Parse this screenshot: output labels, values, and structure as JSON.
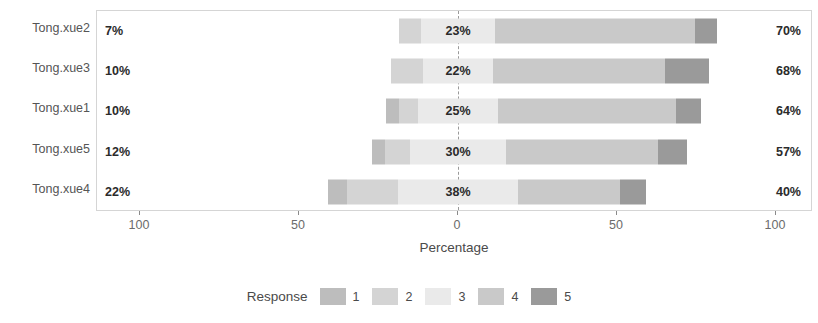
{
  "chart_data": {
    "type": "bar",
    "subtype": "diverging-stacked-likert",
    "title": "",
    "xlabel": "Percentage",
    "ylabel": "",
    "xlim": [
      -100,
      100
    ],
    "xticks": [
      -100,
      -50,
      0,
      50,
      100
    ],
    "xticklabels": [
      "100",
      "50",
      "0",
      "50",
      "100"
    ],
    "grid": false,
    "legend_title": "Response",
    "legend_position": "bottom",
    "categories": [
      "Tong.xue2",
      "Tong.xue3",
      "Tong.xue1",
      "Tong.xue5",
      "Tong.xue4"
    ],
    "series": [
      {
        "name": "1",
        "color": "#bdbdbd",
        "values": [
          0,
          0,
          4,
          4,
          6
        ]
      },
      {
        "name": "2",
        "color": "#d4d4d4",
        "values": [
          7,
          10,
          6,
          8,
          16
        ]
      },
      {
        "name": "3",
        "color": "#eaeaea",
        "values": [
          23,
          22,
          25,
          30,
          38
        ]
      },
      {
        "name": "4",
        "color": "#c9c9c9",
        "values": [
          63,
          54,
          56,
          48,
          32
        ]
      },
      {
        "name": "5",
        "color": "#9a9a9a",
        "values": [
          7,
          14,
          8,
          9,
          8
        ]
      }
    ],
    "rows": [
      {
        "label": "Tong.xue2",
        "left_pct": "7%",
        "mid_pct": "23%",
        "right_pct": "70%",
        "neg": [
          0,
          7
        ],
        "neutral": 23,
        "pos": [
          63,
          7
        ]
      },
      {
        "label": "Tong.xue3",
        "left_pct": "10%",
        "mid_pct": "22%",
        "right_pct": "68%",
        "neg": [
          0,
          10
        ],
        "neutral": 22,
        "pos": [
          54,
          14
        ]
      },
      {
        "label": "Tong.xue1",
        "left_pct": "10%",
        "mid_pct": "25%",
        "right_pct": "64%",
        "neg": [
          4,
          6
        ],
        "neutral": 25,
        "pos": [
          56,
          8
        ]
      },
      {
        "label": "Tong.xue5",
        "left_pct": "12%",
        "mid_pct": "30%",
        "right_pct": "57%",
        "neg": [
          4,
          8
        ],
        "neutral": 30,
        "pos": [
          48,
          9
        ]
      },
      {
        "label": "Tong.xue4",
        "left_pct": "22%",
        "mid_pct": "38%",
        "right_pct": "40%",
        "neg": [
          6,
          16
        ],
        "neutral": 38,
        "pos": [
          32,
          8
        ]
      }
    ],
    "legend_entries": [
      "1",
      "2",
      "3",
      "4",
      "5"
    ],
    "colors": {
      "response_1": "#bdbdbd",
      "response_2": "#d4d4d4",
      "response_3": "#eaeaea",
      "response_4": "#c9c9c9",
      "response_5": "#9a9a9a",
      "panel_border": "#d5d5d5",
      "zero_line": "#9a9a9a",
      "text": "#4a4a4a"
    }
  }
}
